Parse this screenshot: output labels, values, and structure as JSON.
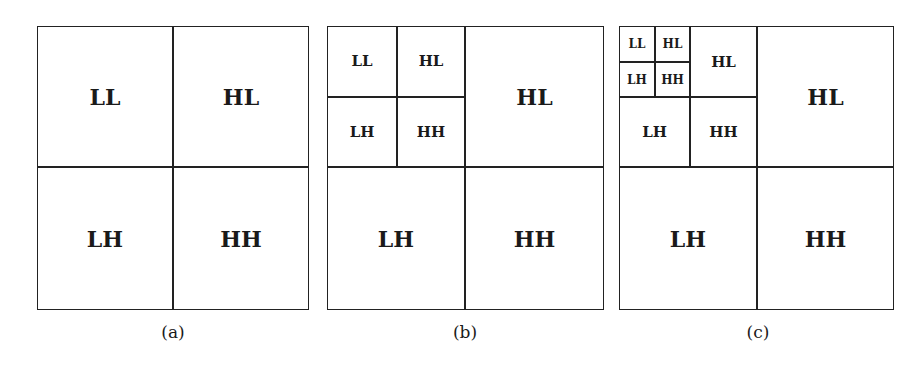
{
  "figure": {
    "panels": [
      {
        "caption": "(a)",
        "level1": {
          "LL": "LL",
          "HL": "HL",
          "LH": "LH",
          "HH": "HH"
        }
      },
      {
        "caption": "(b)",
        "level1": {
          "HL": "HL",
          "LH": "LH",
          "HH": "HH"
        },
        "level2": {
          "LL": "LL",
          "HL": "HL",
          "LH": "LH",
          "HH": "HH"
        }
      },
      {
        "caption": "(c)",
        "level1": {
          "HL": "HL",
          "LH": "LH",
          "HH": "HH"
        },
        "level2": {
          "HL": "HL",
          "LH": "LH",
          "HH": "HH"
        },
        "level3": {
          "LL": "LL",
          "HL": "HL",
          "LH": "LH",
          "HH": "HH"
        }
      }
    ]
  }
}
